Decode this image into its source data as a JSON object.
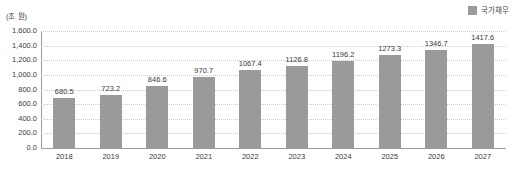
{
  "legend": {
    "position": "top-right",
    "items": [
      {
        "label": "국가채무",
        "color": "#9a9a9a",
        "swatch_name": "legend-swatch-national-debt"
      }
    ]
  },
  "axis": {
    "unit_caption": "(조 원)",
    "y_ticks": [
      "1,600.0",
      "1,400.0",
      "1,200.0",
      "1,000.0",
      "800.0",
      "600.0",
      "400.0",
      "200.0",
      "0.0"
    ],
    "x_ticks": [
      "2018",
      "2019",
      "2020",
      "2021",
      "2022",
      "2023",
      "2024",
      "2025",
      "2026",
      "2027"
    ]
  },
  "bar_labels": [
    "680.5",
    "723.2",
    "846.6",
    "970.7",
    "1067.4",
    "1126.8",
    "1196.2",
    "1273.3",
    "1346.7",
    "1417.6"
  ],
  "colors": {
    "bar": "#9a9a9a",
    "gridline": "#c9c9c9",
    "axis": "#9b9b9b",
    "text": "#3a3a3a",
    "background": "#ffffff"
  },
  "chart_data": {
    "type": "bar",
    "title": "",
    "subtitle": "",
    "xlabel": "",
    "ylabel": "(조 원)",
    "categories": [
      "2018",
      "2019",
      "2020",
      "2021",
      "2022",
      "2023",
      "2024",
      "2025",
      "2026",
      "2027"
    ],
    "series": [
      {
        "name": "국가채무",
        "color": "#9a9a9a",
        "values": [
          680.5,
          723.2,
          846.6,
          970.7,
          1067.4,
          1126.8,
          1196.2,
          1273.3,
          1346.7,
          1417.6
        ]
      }
    ],
    "values": [
      680.5,
      723.2,
      846.6,
      970.7,
      1067.4,
      1126.8,
      1196.2,
      1273.3,
      1346.7,
      1417.6
    ],
    "data_labels": [
      "680.5",
      "723.2",
      "846.6",
      "970.7",
      "1067.4",
      "1126.8",
      "1196.2",
      "1273.3",
      "1346.7",
      "1417.6"
    ],
    "ylim": [
      0,
      1600
    ],
    "ytick_values": [
      0,
      200,
      400,
      600,
      800,
      1000,
      1200,
      1400,
      1600
    ],
    "ytick_labels": [
      "0.0",
      "200.0",
      "400.0",
      "600.0",
      "800.0",
      "1,000.0",
      "1,200.0",
      "1,400.0",
      "1,600.0"
    ],
    "grid": true,
    "grid_axis": "y",
    "grid_style": "dotted",
    "legend_position": "top-right",
    "legend_entries": [
      "국가채무"
    ]
  }
}
